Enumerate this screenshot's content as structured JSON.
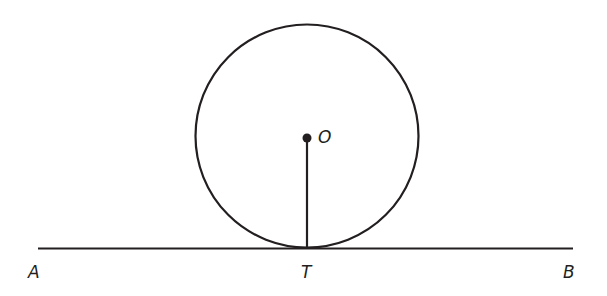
{
  "diagram": {
    "colors": {
      "stroke": "#231f20",
      "background": "#ffffff"
    },
    "circle": {
      "center_label": "O",
      "cx": 307,
      "cy": 136,
      "r": 111
    },
    "line": {
      "start_label": "A",
      "end_label": "B",
      "y": 248.5,
      "x1": 38,
      "x2": 573
    },
    "tangent_point": {
      "label": "T",
      "x": 307,
      "y": 248.5
    },
    "labels": {
      "A": "A",
      "B": "B",
      "T": "T",
      "O": "O"
    }
  }
}
